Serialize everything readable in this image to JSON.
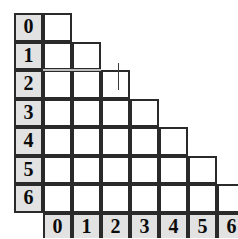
{
  "figure": {
    "name": "lower-triangular-grid",
    "rows": 7,
    "cols": 7,
    "row_headers": [
      "0",
      "1",
      "2",
      "3",
      "4",
      "5",
      "6"
    ],
    "col_headers": [
      "0",
      "1",
      "2",
      "3",
      "4",
      "5",
      "6"
    ],
    "row_cell_counts": [
      1,
      2,
      3,
      4,
      5,
      6,
      7
    ],
    "colors": {
      "header_fill": "#e2e2e2",
      "cell_fill": "#ffffff",
      "border": "#2a2a2a",
      "faded_border": "#bdbdbd",
      "text": "#0b0b0b",
      "background": "#ffffff"
    },
    "geometry": {
      "origin_x": 14,
      "origin_y": 13,
      "cell_w": 29,
      "cell_h": 28.5,
      "header_col_w": 29,
      "header_row_h": 29
    },
    "annotations": {
      "tick_mark": {
        "x": 118,
        "y_top": 63,
        "y_bottom": 90
      },
      "faded_row_divider_index": 2
    }
  }
}
